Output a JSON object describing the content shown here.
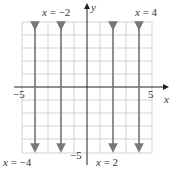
{
  "diagram": {
    "axes": {
      "x_label": "x",
      "y_label": "y",
      "x_min_label": "−5",
      "x_max_label": "5",
      "y_min_label": "−5"
    },
    "lines": [
      {
        "x": -4,
        "label_var": "x",
        "label_eq": "= −4"
      },
      {
        "x": -2,
        "label_var": "x",
        "label_eq": "= −2"
      },
      {
        "x": 2,
        "label_var": "x",
        "label_eq": "= 2"
      },
      {
        "x": 4,
        "label_var": "x",
        "label_eq": "= 4"
      }
    ],
    "colors": {
      "grid": "#c8c8c8",
      "axis": "#222222",
      "line": "#777777"
    }
  }
}
